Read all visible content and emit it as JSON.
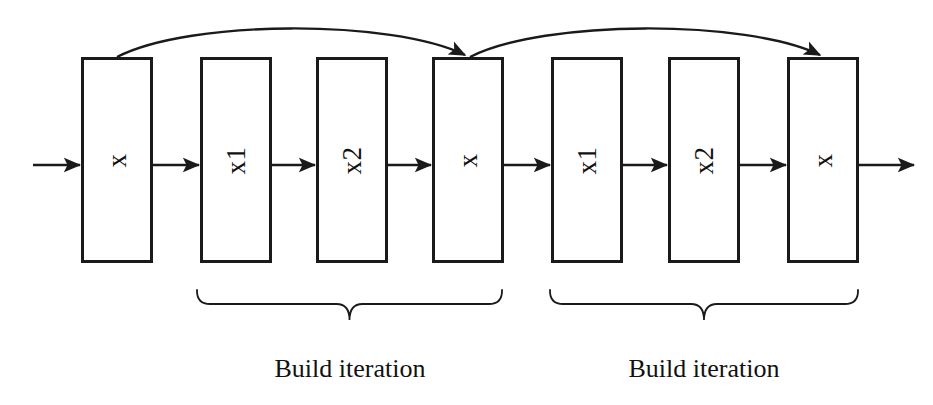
{
  "diagram": {
    "canvas": {
      "width": 933,
      "height": 405,
      "background": "#ffffff"
    },
    "stroke_color": "#1a1a1a",
    "text_color": "#111111",
    "stages": [
      {
        "id": "stage-1",
        "label": "x",
        "x": 81,
        "y": 57,
        "width": 72,
        "height": 206
      },
      {
        "id": "stage-2",
        "label": "x1",
        "x": 200,
        "y": 57,
        "width": 72,
        "height": 206
      },
      {
        "id": "stage-3",
        "label": "x2",
        "x": 316,
        "y": 57,
        "width": 72,
        "height": 206
      },
      {
        "id": "stage-4",
        "label": "x",
        "x": 432,
        "y": 57,
        "width": 72,
        "height": 206
      },
      {
        "id": "stage-5",
        "label": "x1",
        "x": 551,
        "y": 57,
        "width": 72,
        "height": 206
      },
      {
        "id": "stage-6",
        "label": "x2",
        "x": 668,
        "y": 57,
        "width": 72,
        "height": 206
      },
      {
        "id": "stage-7",
        "label": "x",
        "x": 787,
        "y": 57,
        "width": 72,
        "height": 206
      }
    ],
    "flow_arrows": [
      {
        "id": "input-arrow",
        "x1": 33,
        "x2": 81,
        "y": 165
      },
      {
        "id": "arrow-1-2",
        "x1": 153,
        "x2": 200,
        "y": 165
      },
      {
        "id": "arrow-2-3",
        "x1": 272,
        "x2": 316,
        "y": 165
      },
      {
        "id": "arrow-3-4",
        "x1": 388,
        "x2": 432,
        "y": 165
      },
      {
        "id": "arrow-4-5",
        "x1": 504,
        "x2": 551,
        "y": 165
      },
      {
        "id": "arrow-5-6",
        "x1": 623,
        "x2": 668,
        "y": 165
      },
      {
        "id": "arrow-6-7",
        "x1": 740,
        "x2": 787,
        "y": 165
      },
      {
        "id": "output-arrow",
        "x1": 859,
        "x2": 915,
        "y": 165
      }
    ],
    "feedback_arrows": [
      {
        "id": "feedback-1",
        "from_stage": "stage-1",
        "to_stage": "stage-4",
        "x1": 117,
        "y1": 57,
        "x2": 465,
        "y2": 57,
        "peak_y": 25
      },
      {
        "id": "feedback-2",
        "from_stage": "stage-4",
        "to_stage": "stage-7",
        "x1": 470,
        "y1": 57,
        "x2": 820,
        "y2": 57,
        "peak_y": 25
      }
    ],
    "groups": [
      {
        "id": "group-1",
        "caption": "Build iteration",
        "brace_x1": 197,
        "brace_x2": 502,
        "brace_y": 290,
        "brace_depth": 30,
        "caption_center_x": 350,
        "caption_y": 354
      },
      {
        "id": "group-2",
        "caption": "Build iteration",
        "brace_x1": 550,
        "brace_x2": 858,
        "brace_y": 290,
        "brace_depth": 30,
        "caption_center_x": 704,
        "caption_y": 354
      }
    ]
  }
}
